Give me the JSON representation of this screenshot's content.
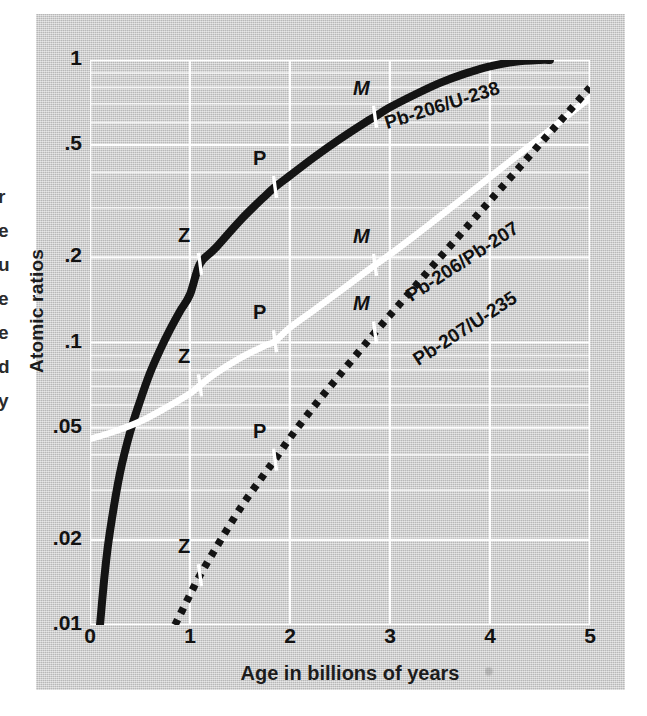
{
  "figure": {
    "margin_text_fragments": [
      "r",
      "e",
      "u",
      "e",
      "e",
      "d",
      "y"
    ],
    "background_color": "#c9c9c9",
    "gridline_color": "#ffffff"
  },
  "axes": {
    "y_title": "Atomic ratios",
    "x_title": "Age in billions of years",
    "y_ticks": [
      "1",
      ".5",
      ".2",
      ".1",
      ".05",
      ".02",
      ".01"
    ],
    "y_tick_values": [
      1,
      0.5,
      0.2,
      0.1,
      0.05,
      0.02,
      0.01
    ],
    "x_ticks": [
      "0",
      "1",
      "2",
      "3",
      "4",
      "5"
    ],
    "x_tick_values": [
      0,
      1,
      2,
      3,
      4,
      5
    ],
    "y_scale": "log",
    "x_scale": "linear"
  },
  "chart_data": {
    "type": "line",
    "title": "",
    "xlabel": "Age in billions of years",
    "ylabel": "Atomic ratios",
    "xlim": [
      0,
      5
    ],
    "ylim": [
      0.01,
      1.0
    ],
    "yscale": "log",
    "grid": true,
    "legend": "inline-curve-labels",
    "series": [
      {
        "name": "Pb-206/U-238",
        "style": "solid-black",
        "color": "#141414",
        "label_text": "Pb-206/U-238",
        "points": [
          [
            0.1,
            0.01
          ],
          [
            0.15,
            0.0155
          ],
          [
            0.2,
            0.0215
          ],
          [
            0.3,
            0.0345
          ],
          [
            0.4,
            0.048
          ],
          [
            0.5,
            0.062
          ],
          [
            0.6,
            0.078
          ],
          [
            0.7,
            0.094
          ],
          [
            0.8,
            0.111
          ],
          [
            0.9,
            0.129
          ],
          [
            1.0,
            0.148
          ],
          [
            1.1,
            0.19
          ],
          [
            1.25,
            0.215
          ],
          [
            1.5,
            0.27
          ],
          [
            1.75,
            0.33
          ],
          [
            1.85,
            0.355
          ],
          [
            2.0,
            0.39
          ],
          [
            2.25,
            0.455
          ],
          [
            2.5,
            0.525
          ],
          [
            2.75,
            0.6
          ],
          [
            2.85,
            0.63
          ],
          [
            3.0,
            0.68
          ],
          [
            3.25,
            0.755
          ],
          [
            3.5,
            0.83
          ],
          [
            3.75,
            0.895
          ],
          [
            4.0,
            0.95
          ],
          [
            4.25,
            0.985
          ],
          [
            4.5,
            1.0
          ],
          [
            4.6,
            1.0
          ]
        ],
        "markers": [
          {
            "label": "Z",
            "x": 1.1,
            "y": 0.19
          },
          {
            "label": "P",
            "x": 1.85,
            "y": 0.355
          },
          {
            "label": "M",
            "x": 2.85,
            "y": 0.63
          }
        ]
      },
      {
        "name": "Pb-206/Pb-207",
        "style": "solid-white",
        "color": "#ffffff",
        "label_text": "Pb-206/Pb-207",
        "points": [
          [
            0.0,
            0.0455
          ],
          [
            0.25,
            0.0485
          ],
          [
            0.5,
            0.0525
          ],
          [
            0.75,
            0.0585
          ],
          [
            1.0,
            0.066
          ],
          [
            1.1,
            0.0705
          ],
          [
            1.25,
            0.0775
          ],
          [
            1.5,
            0.088
          ],
          [
            1.75,
            0.0975
          ],
          [
            1.85,
            0.101
          ],
          [
            2.0,
            0.113
          ],
          [
            2.25,
            0.131
          ],
          [
            2.5,
            0.152
          ],
          [
            2.75,
            0.177
          ],
          [
            2.85,
            0.188
          ],
          [
            3.0,
            0.205
          ],
          [
            3.25,
            0.239
          ],
          [
            3.5,
            0.28
          ],
          [
            3.75,
            0.328
          ],
          [
            4.0,
            0.385
          ],
          [
            4.25,
            0.452
          ],
          [
            4.5,
            0.53
          ],
          [
            4.75,
            0.625
          ],
          [
            5.0,
            0.735
          ]
        ],
        "markers": [
          {
            "label": "Z",
            "x": 1.1,
            "y": 0.0705
          },
          {
            "label": "P",
            "x": 1.85,
            "y": 0.101
          },
          {
            "label": "M",
            "x": 2.85,
            "y": 0.188
          }
        ]
      },
      {
        "name": "Pb-207/U-235",
        "style": "dotted-black",
        "color": "#141414",
        "label_text": "Pb-207/U-235",
        "points": [
          [
            0.85,
            0.01
          ],
          [
            1.0,
            0.0128
          ],
          [
            1.1,
            0.015
          ],
          [
            1.25,
            0.0185
          ],
          [
            1.5,
            0.0258
          ],
          [
            1.75,
            0.0345
          ],
          [
            1.85,
            0.0385
          ],
          [
            2.0,
            0.046
          ],
          [
            2.25,
            0.06
          ],
          [
            2.5,
            0.077
          ],
          [
            2.75,
            0.0985
          ],
          [
            2.85,
            0.1085
          ],
          [
            3.0,
            0.125
          ],
          [
            3.25,
            0.158
          ],
          [
            3.5,
            0.2
          ],
          [
            3.75,
            0.252
          ],
          [
            4.0,
            0.318
          ],
          [
            4.25,
            0.4
          ],
          [
            4.5,
            0.505
          ],
          [
            4.75,
            0.635
          ],
          [
            5.0,
            0.8
          ]
        ],
        "markers": [
          {
            "label": "Z",
            "x": 1.1,
            "y": 0.015
          },
          {
            "label": "P",
            "x": 1.85,
            "y": 0.0385
          },
          {
            "label": "M",
            "x": 2.85,
            "y": 0.1085
          }
        ]
      }
    ],
    "marker_legend": {
      "Z": "Zircon sample",
      "P": "Pitchblende sample",
      "M": "Monazite sample"
    }
  }
}
